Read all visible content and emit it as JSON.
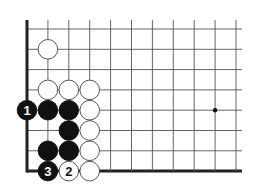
{
  "diagram": {
    "type": "go-board-corner",
    "grid": {
      "origin_x": 27,
      "origin_y": 29,
      "spacing_x": 20.9,
      "spacing_y": 20.3,
      "cols": 11,
      "rows": 8,
      "top_extend": 9,
      "right_extend": 6,
      "edges": [
        "left",
        "bottom"
      ],
      "line_color": "#555555",
      "edge_color": "#222222"
    },
    "star_points": [
      {
        "col": 9,
        "row": 4
      }
    ],
    "stones": [
      {
        "color": "white",
        "col": 1,
        "row": 1,
        "label": ""
      },
      {
        "color": "white",
        "col": 1,
        "row": 3,
        "label": ""
      },
      {
        "color": "white",
        "col": 2,
        "row": 3,
        "label": ""
      },
      {
        "color": "white",
        "col": 3,
        "row": 3,
        "label": ""
      },
      {
        "color": "black",
        "col": 0,
        "row": 4,
        "label": "1"
      },
      {
        "color": "black",
        "col": 1,
        "row": 4,
        "label": ""
      },
      {
        "color": "black",
        "col": 2,
        "row": 4,
        "label": ""
      },
      {
        "color": "white",
        "col": 3,
        "row": 4,
        "label": ""
      },
      {
        "color": "black",
        "col": 2,
        "row": 5,
        "label": ""
      },
      {
        "color": "white",
        "col": 3,
        "row": 5,
        "label": ""
      },
      {
        "color": "black",
        "col": 1,
        "row": 6,
        "label": ""
      },
      {
        "color": "black",
        "col": 2,
        "row": 6,
        "label": ""
      },
      {
        "color": "white",
        "col": 3,
        "row": 6,
        "label": ""
      },
      {
        "color": "black",
        "col": 1,
        "row": 7,
        "label": "3"
      },
      {
        "color": "white",
        "col": 2,
        "row": 7,
        "label": "2"
      },
      {
        "color": "white",
        "col": 3,
        "row": 7,
        "label": ""
      }
    ],
    "colors": {
      "black_stone": "#111111",
      "white_stone": "#ffffff",
      "stone_outline": "#444444"
    }
  }
}
